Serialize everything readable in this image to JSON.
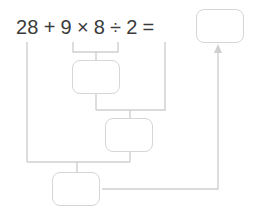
{
  "problem": {
    "expression_tokens": [
      {
        "name": "operand-28",
        "text": "28"
      },
      {
        "name": "operator-plus",
        "text": "+"
      },
      {
        "name": "operand-9",
        "text": "9"
      },
      {
        "name": "operator-times",
        "text": "×"
      },
      {
        "name": "operand-8",
        "text": "8"
      },
      {
        "name": "operator-divide",
        "text": "÷"
      },
      {
        "name": "operand-2",
        "text": "2"
      },
      {
        "name": "operator-equals",
        "text": "="
      }
    ],
    "expression_text": "28 + 9 × 8 ÷ 2 =",
    "answer_box_value": "",
    "work_boxes": [
      {
        "name": "step-1",
        "value": ""
      },
      {
        "name": "step-2",
        "value": ""
      },
      {
        "name": "step-3",
        "value": ""
      }
    ]
  },
  "style": {
    "text_color": "#3b3b3b",
    "line_color": "#cfcfcf",
    "box_border_color": "#d6d6d6",
    "background": "#ffffff"
  }
}
